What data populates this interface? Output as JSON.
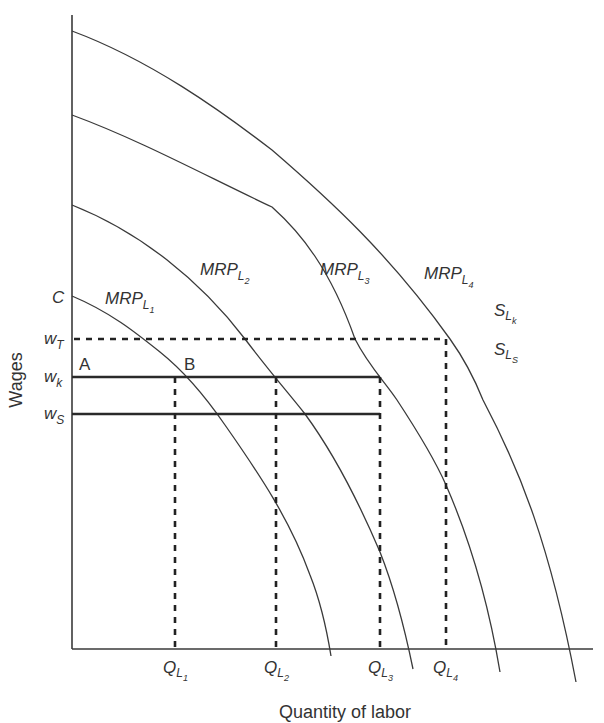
{
  "diagram": {
    "type": "economics-labor-market",
    "y_axis_title": "Wages",
    "x_axis_title": "Quantity of labor",
    "y_axis_labels": [
      {
        "id": "C",
        "main": "C",
        "sub": ""
      },
      {
        "id": "wT",
        "main": "w",
        "sub": "T"
      },
      {
        "id": "wk",
        "main": "w",
        "sub": "k"
      },
      {
        "id": "ws",
        "main": "w",
        "sub": "S"
      }
    ],
    "x_axis_labels": [
      {
        "id": "QL1",
        "main": "Q",
        "sub": "L",
        "subsub": "1"
      },
      {
        "id": "QL2",
        "main": "Q",
        "sub": "L",
        "subsub": "2"
      },
      {
        "id": "QL3",
        "main": "Q",
        "sub": "L",
        "subsub": "3"
      },
      {
        "id": "QL4",
        "main": "Q",
        "sub": "L",
        "subsub": "4"
      }
    ],
    "curves": [
      {
        "id": "MRP_L1",
        "main": "MRP",
        "sub": "L",
        "subsub": "1"
      },
      {
        "id": "MRP_L2",
        "main": "MRP",
        "sub": "L",
        "subsub": "2"
      },
      {
        "id": "MRP_L3",
        "main": "MRP",
        "sub": "L",
        "subsub": "3"
      },
      {
        "id": "MRP_L4",
        "main": "MRP",
        "sub": "L",
        "subsub": "4"
      }
    ],
    "supply_labels": [
      {
        "id": "S_Lk",
        "main": "S",
        "sub": "L",
        "subsub": "k"
      },
      {
        "id": "S_Ls",
        "main": "S",
        "sub": "L",
        "subsub": "S"
      }
    ],
    "points": [
      {
        "id": "A",
        "label": "A"
      },
      {
        "id": "B",
        "label": "B"
      }
    ],
    "lines": {
      "wT": {
        "style": "dashed",
        "from": "axis",
        "to": "QL4"
      },
      "wk": {
        "style": "solid",
        "from": "axis",
        "to": "QL3"
      },
      "ws": {
        "style": "solid",
        "from": "axis",
        "to": "QL3"
      }
    }
  }
}
